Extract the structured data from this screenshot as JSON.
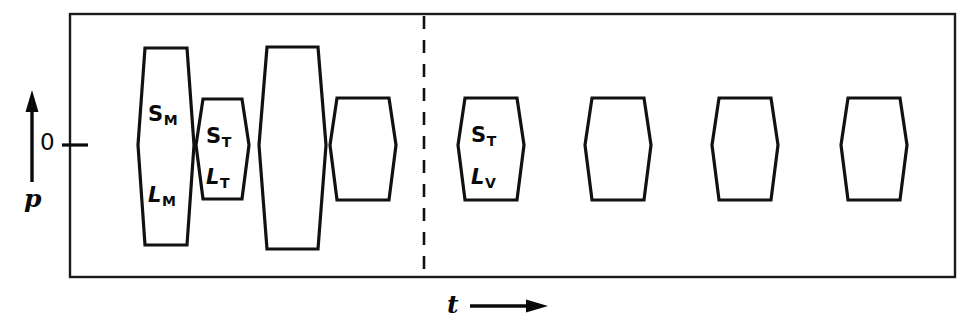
{
  "figure": {
    "kind": "pulse-sequence-timing-diagram",
    "background_color": "#ffffff",
    "line_color": "#111111",
    "frame": {
      "x": 70,
      "y": 14,
      "width": 885,
      "height": 263
    },
    "axes": {
      "y_axis_label": "p",
      "y_axis_arrow": "up-arrow",
      "y_zero_label": "0",
      "y_zero_tick_y": 145,
      "x_axis_label": "t",
      "x_axis_arrow": "right-arrow"
    },
    "divider": {
      "name": "dashed-separator",
      "x": 424,
      "style": "dashed"
    },
    "baseline_y": 145
  },
  "chart_data": {
    "type": "timing-diagram",
    "title": "",
    "xlabel": "t",
    "ylabel": "p",
    "grid": false,
    "legend": "none",
    "baseline_value": 0,
    "groups": [
      {
        "name": "left-group",
        "pulse_indices": [
          0,
          1,
          2,
          3
        ]
      },
      {
        "name": "right-group",
        "pulse_indices": [
          4,
          5,
          6,
          7
        ]
      }
    ],
    "pulses": [
      {
        "id": "pulse-sm-lm",
        "group": "left-group",
        "x_left": 142,
        "x_right": 190,
        "top": 48,
        "bottom": 245,
        "waist_y": 145,
        "waist_inset": 4,
        "top_inset": 3,
        "bottom_inset": 3,
        "amplitude_up": 97,
        "amplitude_down": 100,
        "labels": [
          {
            "main": "S",
            "sub": "M",
            "italic": false,
            "x": 148,
            "y": 104
          },
          {
            "main": "L",
            "sub": "M",
            "italic": true,
            "x": 148,
            "y": 185
          }
        ]
      },
      {
        "id": "pulse-st-lt",
        "group": "left-group",
        "x_left": 200,
        "x_right": 245,
        "top": 99,
        "bottom": 199,
        "waist_y": 145,
        "waist_inset": 4,
        "top_inset": 3,
        "bottom_inset": 3,
        "amplitude_up": 46,
        "amplitude_down": 54,
        "labels": [
          {
            "main": "S",
            "sub": "T",
            "italic": false,
            "x": 206,
            "y": 126
          },
          {
            "main": "L",
            "sub": "T",
            "italic": true,
            "x": 206,
            "y": 167
          }
        ]
      },
      {
        "id": "pulse-tall-unlabelled",
        "group": "left-group",
        "x_left": 264,
        "x_right": 321,
        "top": 47,
        "bottom": 249,
        "waist_y": 145,
        "waist_inset": 5,
        "top_inset": 3,
        "bottom_inset": 3,
        "amplitude_up": 98,
        "amplitude_down": 104,
        "labels": []
      },
      {
        "id": "pulse-fourth-unlabelled",
        "group": "left-group",
        "x_left": 334,
        "x_right": 392,
        "top": 98,
        "bottom": 200,
        "waist_y": 145,
        "waist_inset": 4,
        "top_inset": 3,
        "bottom_inset": 3,
        "amplitude_up": 47,
        "amplitude_down": 55,
        "labels": []
      },
      {
        "id": "pulse-st-lv",
        "group": "right-group",
        "x_left": 462,
        "x_right": 520,
        "top": 98,
        "bottom": 200,
        "waist_y": 145,
        "waist_inset": 4,
        "top_inset": 3,
        "bottom_inset": 3,
        "amplitude_up": 47,
        "amplitude_down": 55,
        "labels": [
          {
            "main": "S",
            "sub": "T",
            "italic": false,
            "x": 471,
            "y": 125
          },
          {
            "main": "L",
            "sub": "V",
            "italic": true,
            "x": 471,
            "y": 167
          }
        ]
      },
      {
        "id": "pulse-echo-1",
        "group": "right-group",
        "x_left": 589,
        "x_right": 647,
        "top": 98,
        "bottom": 200,
        "waist_y": 145,
        "waist_inset": 4,
        "top_inset": 3,
        "bottom_inset": 3,
        "amplitude_up": 47,
        "amplitude_down": 55,
        "labels": []
      },
      {
        "id": "pulse-echo-2",
        "group": "right-group",
        "x_left": 716,
        "x_right": 774,
        "top": 98,
        "bottom": 200,
        "waist_y": 145,
        "waist_inset": 4,
        "top_inset": 3,
        "bottom_inset": 3,
        "amplitude_up": 47,
        "amplitude_down": 55,
        "labels": []
      },
      {
        "id": "pulse-echo-3",
        "group": "right-group",
        "x_left": 845,
        "x_right": 903,
        "top": 98,
        "bottom": 200,
        "waist_y": 145,
        "waist_inset": 4,
        "top_inset": 3,
        "bottom_inset": 3,
        "amplitude_up": 47,
        "amplitude_down": 55,
        "labels": []
      }
    ]
  }
}
